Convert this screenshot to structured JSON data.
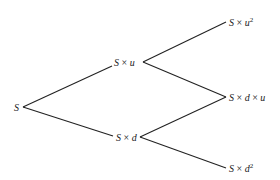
{
  "diagram": {
    "type": "binomial-tree",
    "nodes": [
      {
        "id": "root",
        "parts": [
          "S"
        ],
        "sup": ""
      },
      {
        "id": "up",
        "parts": [
          "S",
          " × ",
          "u"
        ],
        "sup": ""
      },
      {
        "id": "down",
        "parts": [
          "S",
          " × ",
          "d"
        ],
        "sup": ""
      },
      {
        "id": "uu",
        "parts": [
          "S",
          " × ",
          "u"
        ],
        "sup": "2"
      },
      {
        "id": "du",
        "parts": [
          "S",
          " × ",
          "d",
          " × ",
          "u"
        ],
        "sup": ""
      },
      {
        "id": "dd",
        "parts": [
          "S",
          " × ",
          "d"
        ],
        "sup": "2"
      }
    ],
    "edges": [
      [
        "root",
        "up"
      ],
      [
        "root",
        "down"
      ],
      [
        "up",
        "uu"
      ],
      [
        "up",
        "du"
      ],
      [
        "down",
        "du"
      ],
      [
        "down",
        "dd"
      ]
    ]
  }
}
